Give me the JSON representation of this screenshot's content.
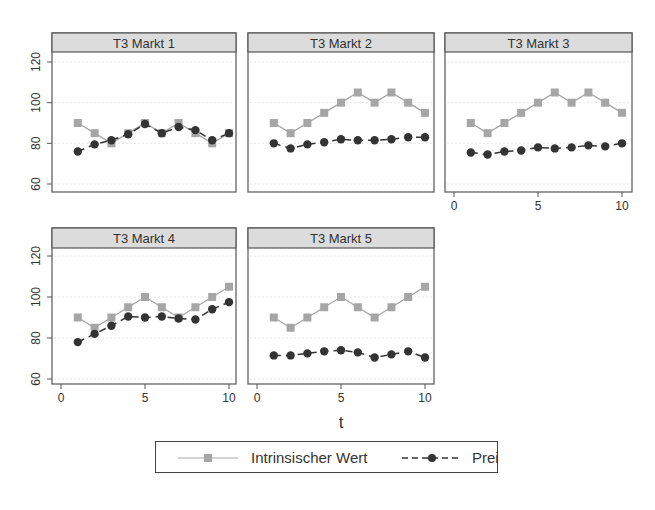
{
  "chart_data": {
    "type": "line",
    "layout": "small-multiples 2x3 (5 panels)",
    "xlabel": "t",
    "ylabel": "",
    "xlim": [
      0,
      10
    ],
    "ylim": [
      60,
      120
    ],
    "xticks": [
      0,
      5,
      10
    ],
    "yticks": [
      60,
      80,
      100,
      120
    ],
    "grid": true,
    "legend_position": "bottom",
    "legend": [
      {
        "name": "Intrinsischer Wert",
        "style": "solid",
        "marker": "square",
        "color": "#a6a6a6"
      },
      {
        "name": "Preis",
        "style": "dashed",
        "marker": "circle",
        "color": "#333333"
      }
    ],
    "x": [
      1,
      2,
      3,
      4,
      5,
      6,
      7,
      8,
      9,
      10
    ],
    "panels": [
      {
        "title": "T3 Markt 1",
        "series": [
          {
            "name": "Intrinsischer Wert",
            "values": [
              90,
              85,
              80,
              85,
              90,
              85,
              90,
              85,
              80,
              85
            ]
          },
          {
            "name": "Preis",
            "values": [
              76,
              79.5,
              81.5,
              84.5,
              89.5,
              85,
              88,
              86.5,
              81.5,
              85
            ]
          }
        ]
      },
      {
        "title": "T3 Markt 2",
        "series": [
          {
            "name": "Intrinsischer Wert",
            "values": [
              90,
              85,
              90,
              95,
              100,
              105,
              100,
              105,
              100,
              95
            ]
          },
          {
            "name": "Preis",
            "values": [
              80,
              77.5,
              79.5,
              80.5,
              82,
              81.5,
              81.5,
              82,
              83,
              83
            ]
          }
        ]
      },
      {
        "title": "T3 Markt 3",
        "series": [
          {
            "name": "Intrinsischer Wert",
            "values": [
              90,
              85,
              90,
              95,
              100,
              105,
              100,
              105,
              100,
              95
            ]
          },
          {
            "name": "Preis",
            "values": [
              75.5,
              74.5,
              76,
              76.5,
              78,
              77.5,
              78,
              79,
              78.5,
              80
            ]
          }
        ]
      },
      {
        "title": "T3 Markt 4",
        "series": [
          {
            "name": "Intrinsischer Wert",
            "values": [
              90,
              85,
              90,
              95,
              100,
              95,
              90,
              95,
              100,
              105
            ]
          },
          {
            "name": "Preis",
            "values": [
              78,
              82,
              86,
              90.5,
              90,
              90.5,
              89.5,
              89,
              94,
              97.5
            ]
          }
        ]
      },
      {
        "title": "T3 Markt 5",
        "series": [
          {
            "name": "Intrinsischer Wert",
            "values": [
              90,
              85,
              90,
              95,
              100,
              95,
              90,
              95,
              100,
              105
            ]
          },
          {
            "name": "Preis",
            "values": [
              71.5,
              71.5,
              72.5,
              73.5,
              74,
              73,
              70.5,
              72,
              73.5,
              70.5
            ]
          }
        ]
      }
    ]
  },
  "colors": {
    "intrinsic": "#a6a6a6",
    "price": "#333333",
    "header_bg": "#dcdcdc",
    "border": "#555555",
    "grid": "#e6e6e6"
  }
}
